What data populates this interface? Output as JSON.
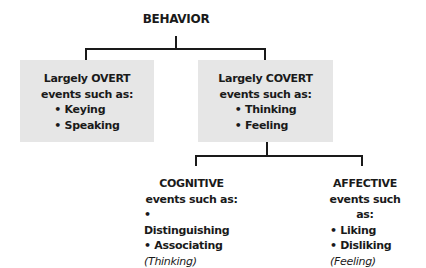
{
  "root": {
    "label": "BEHAVIOR"
  },
  "overt": {
    "title": "Largely OVERT",
    "subtitle": "events such as:",
    "items": [
      "• Keying",
      "• Speaking"
    ]
  },
  "covert": {
    "title": "Largely COVERT",
    "subtitle": "events such as:",
    "items": [
      "• Thinking",
      "• Feeling"
    ]
  },
  "cognitive": {
    "title": "COGNITIVE",
    "subtitle": "events such as:",
    "items": [
      "• Distinguishing",
      "• Associating"
    ],
    "note": "(Thinking)"
  },
  "affective": {
    "title": "AFFECTIVE",
    "subtitle": "events such as:",
    "items": [
      "• Liking",
      "• Disliking"
    ],
    "note": "(Feeling)"
  },
  "colors": {
    "box_fill": "#e6e6e6",
    "line": "#1a1a1a"
  }
}
